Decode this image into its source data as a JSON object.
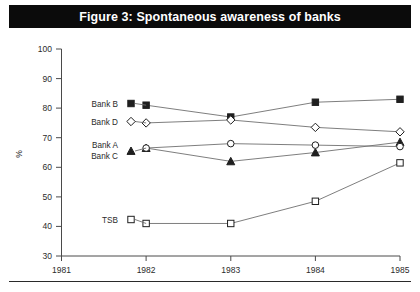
{
  "figure": {
    "title": "Figure 3: Spontaneous awareness of banks",
    "title_bar_color": "#0b0b0b",
    "title_text_color": "#ffffff",
    "background_color": "#ffffff",
    "ink_color": "#2b2b2b"
  },
  "chart_data": {
    "type": "line",
    "title": "Figure 3: Spontaneous awareness of banks",
    "xlabel": "",
    "ylabel": "%",
    "x": [
      1981,
      1982,
      1983,
      1984,
      1985
    ],
    "xtick_labels": [
      "1981",
      "1982",
      "1983",
      "1984",
      "1985"
    ],
    "xlim": [
      1981,
      1985
    ],
    "ylim": [
      30,
      100
    ],
    "ytick_labels": [
      "30",
      "40",
      "50",
      "60",
      "70",
      "80",
      "90",
      "100"
    ],
    "ytick_values": [
      30,
      40,
      50,
      60,
      70,
      80,
      90,
      100
    ],
    "grid": false,
    "legend_position": "inline-left",
    "series": [
      {
        "name": "Bank B",
        "label": "Bank B",
        "marker": "filled-square",
        "x": [
          1982,
          1983,
          1984,
          1985
        ],
        "values": [
          81,
          77,
          82,
          83
        ]
      },
      {
        "name": "Bank D",
        "label": "Bank D",
        "marker": "open-diamond",
        "x": [
          1982,
          1983,
          1984,
          1985
        ],
        "values": [
          75,
          76,
          73.5,
          72
        ]
      },
      {
        "name": "Bank A",
        "label": "Bank A",
        "marker": "filled-triangle",
        "x": [
          1982,
          1983,
          1984,
          1985
        ],
        "values": [
          66.5,
          62,
          65,
          68.5
        ]
      },
      {
        "name": "Bank C",
        "label": "Bank C",
        "marker": "open-circle",
        "x": [
          1982,
          1983,
          1984,
          1985
        ],
        "values": [
          66.5,
          68,
          67.5,
          67
        ]
      },
      {
        "name": "TSB",
        "label": "TSB",
        "marker": "open-square",
        "x": [
          1982,
          1983,
          1984,
          1985
        ],
        "values": [
          41,
          41,
          48.5,
          61.5
        ]
      }
    ]
  }
}
